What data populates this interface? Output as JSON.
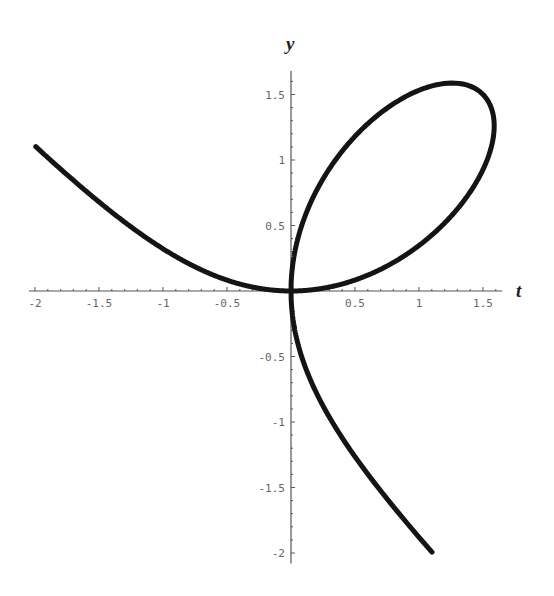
{
  "chart_data": {
    "type": "line",
    "title": "",
    "xlabel": "t",
    "ylabel": "y",
    "equation": "t^3 + y^3 = 3 t y",
    "xlim": [
      -2,
      1.65
    ],
    "ylim": [
      -2.08,
      1.68
    ],
    "grid": false,
    "legend": null,
    "x_ticks": [
      {
        "value": -2,
        "label": "-2"
      },
      {
        "value": -1.5,
        "label": "-1.5"
      },
      {
        "value": -1,
        "label": "-1"
      },
      {
        "value": -0.5,
        "label": "-0.5"
      },
      {
        "value": 0.5,
        "label": "0.5"
      },
      {
        "value": 1,
        "label": "1"
      },
      {
        "value": 1.5,
        "label": "1.5"
      }
    ],
    "y_ticks": [
      {
        "value": 1.5,
        "label": "1.5"
      },
      {
        "value": 1,
        "label": "1"
      },
      {
        "value": 0.5,
        "label": "0.5"
      },
      {
        "value": -0.5,
        "label": "-0.5"
      },
      {
        "value": -1,
        "label": "-1"
      },
      {
        "value": -1.5,
        "label": "-1.5"
      },
      {
        "value": -2,
        "label": "-2"
      }
    ],
    "minor_ticks_per_major": 4,
    "series": [
      {
        "name": "folium",
        "points": [
          [
            -2.0,
            1.11
          ],
          [
            -1.5,
            0.77
          ],
          [
            -1.0,
            0.45
          ],
          [
            -0.5,
            0.16
          ],
          [
            -0.25,
            0.05
          ],
          [
            0,
            0
          ],
          [
            0.25,
            0.02
          ],
          [
            0.5,
            0.09
          ],
          [
            0.75,
            0.21
          ],
          [
            1.0,
            0.38
          ],
          [
            1.25,
            0.64
          ],
          [
            1.45,
            0.98
          ],
          [
            1.5,
            1.5
          ],
          [
            1.587,
            1.26
          ],
          [
            1.5,
            1.5
          ],
          [
            1.26,
            1.587
          ],
          [
            1.0,
            1.53
          ],
          [
            0.75,
            1.38
          ],
          [
            0.5,
            1.19
          ],
          [
            0.25,
            0.83
          ],
          [
            0.1,
            0.54
          ],
          [
            0.02,
            0.25
          ],
          [
            0,
            0
          ],
          [
            0.05,
            -0.25
          ],
          [
            0.16,
            -0.5
          ],
          [
            0.45,
            -1.0
          ],
          [
            0.77,
            -1.5
          ],
          [
            1.11,
            -2.0
          ]
        ]
      }
    ],
    "style": {
      "curve_color": "#141414",
      "axis_color": "#555555",
      "tick_label_color": "#666666"
    }
  }
}
